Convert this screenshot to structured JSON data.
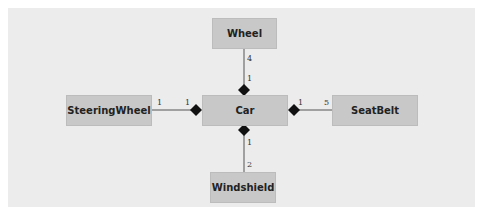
{
  "diagram": {
    "type": "uml-class-composition",
    "classes": {
      "car": "Car",
      "wheel": "Wheel",
      "steering_wheel": "SteeringWheel",
      "seat_belt": "SeatBelt",
      "windshield": "Windshield"
    },
    "relationships": [
      {
        "whole": "Car",
        "part": "Wheel",
        "whole_mult": "1",
        "part_mult": "4"
      },
      {
        "whole": "Car",
        "part": "SteeringWheel",
        "whole_mult": "1",
        "part_mult": "1"
      },
      {
        "whole": "Car",
        "part": "SeatBelt",
        "whole_mult": "1",
        "part_mult": "5"
      },
      {
        "whole": "Car",
        "part": "Windshield",
        "whole_mult": "1",
        "part_mult": "2"
      }
    ],
    "colors": {
      "panel": "#ececec",
      "box": "#c8c8c8",
      "line": "#555555",
      "diamond": "#111111"
    }
  }
}
